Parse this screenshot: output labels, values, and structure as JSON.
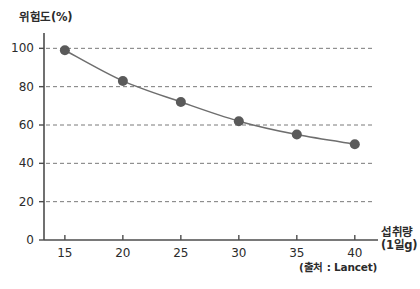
{
  "chart_data": {
    "type": "line",
    "title": "",
    "subtitle": "",
    "ylabel": "위험도(%)",
    "xlabel": "섭취량",
    "xlabel_unit": "(1일g)",
    "source_note": "(출처 : Lancet)",
    "x": [
      15,
      20,
      25,
      30,
      35,
      40
    ],
    "values": [
      99,
      83,
      72,
      62,
      55,
      50
    ],
    "series": [
      {
        "name": "위험도(%)",
        "x": [
          15,
          20,
          25,
          30,
          35,
          40
        ],
        "values": [
          99,
          83,
          72,
          62,
          55,
          50
        ]
      }
    ],
    "xlim": [
      13.2,
      42.0
    ],
    "ylim": [
      0,
      108
    ],
    "x_ticks": [
      15,
      20,
      25,
      30,
      35,
      40
    ],
    "x_tick_labels": [
      "15",
      "20",
      "25",
      "30",
      "35",
      "40"
    ],
    "y_ticks": [
      0,
      20,
      40,
      60,
      80,
      100
    ],
    "y_tick_labels": [
      "0",
      "20",
      "40",
      "60",
      "80",
      "100"
    ],
    "grid": "horizontal-dashed",
    "legend": "none",
    "marker": "filled-circle",
    "colors": {
      "line": "#6e6e6e",
      "marker": "#5a5a5a",
      "axis": "#4d4d4d",
      "grid": "#7a7a7a",
      "text": "#2b2b2b",
      "background": "#ffffff"
    }
  }
}
